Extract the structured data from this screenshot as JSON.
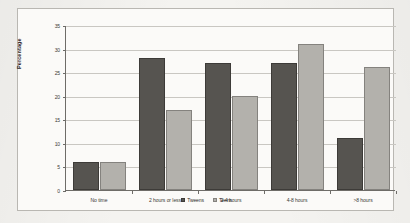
{
  "chart_data": {
    "type": "bar",
    "title": "",
    "xlabel": "",
    "ylabel": "Percentage",
    "ylim": [
      0,
      35
    ],
    "yticks": [
      0,
      5,
      10,
      15,
      20,
      25,
      30,
      35
    ],
    "grid": true,
    "legend_position": "bottom-center",
    "categories": [
      "No time",
      "2 hours or less",
      "2-4 hours",
      "4-8 hours",
      ">8 hours"
    ],
    "series": [
      {
        "name": "Tweens",
        "color": "#565450",
        "values": [
          6,
          28,
          27,
          27,
          11
        ]
      },
      {
        "name": "Teens",
        "color": "#b3b1ac",
        "values": [
          6,
          17,
          20,
          31,
          26
        ]
      }
    ]
  },
  "figure": {
    "background_color": "#f4f3f0",
    "plot_background_color": "#fbfaf8",
    "frame_color": "#b9b7b2",
    "axis_color": "#6e6c68",
    "gridline_color": "#c9c7c2"
  }
}
